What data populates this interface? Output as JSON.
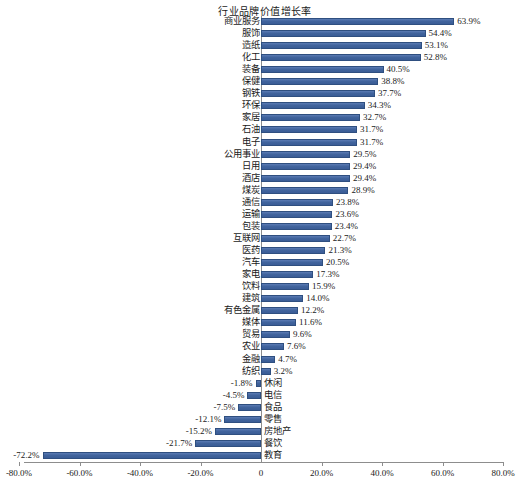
{
  "chart_data": {
    "type": "bar",
    "orientation": "horizontal",
    "title": "行业品牌价值增长率",
    "xlabel": "",
    "ylabel": "",
    "xlim": [
      -80,
      80
    ],
    "grid": false,
    "legend": null,
    "axis_tick_labels": [
      "-80.0%",
      "-60.0%",
      "-40.0%",
      "-20.0%",
      "0",
      "20.0%",
      "40.0%",
      "60.0%",
      "80.0%"
    ],
    "axis_tick_values": [
      -80,
      -60,
      -40,
      -20,
      0,
      20,
      40,
      60,
      80
    ],
    "bar_color": "#41649d",
    "bar_border_color": "#2f4f80",
    "categories": [
      "商业服务",
      "服饰",
      "造纸",
      "化工",
      "装备",
      "保健",
      "钢铁",
      "环保",
      "家居",
      "石油",
      "电子",
      "公用事业",
      "日用",
      "酒店",
      "煤炭",
      "通信",
      "运输",
      "包装",
      "互联网",
      "医药",
      "汽车",
      "家电",
      "饮料",
      "建筑",
      "有色金属",
      "媒体",
      "贸易",
      "农业",
      "金融",
      "纺织",
      "休闲",
      "电信",
      "食品",
      "零售",
      "房地产",
      "餐饮",
      "教育"
    ],
    "values": [
      63.9,
      54.4,
      53.1,
      52.8,
      40.5,
      38.8,
      37.7,
      34.3,
      32.7,
      31.7,
      31.7,
      29.5,
      29.4,
      29.4,
      28.9,
      23.8,
      23.6,
      23.4,
      22.7,
      21.3,
      20.5,
      17.3,
      15.9,
      14.0,
      12.2,
      11.6,
      9.6,
      7.6,
      4.7,
      3.2,
      -1.8,
      -4.5,
      -7.5,
      -12.1,
      -15.2,
      -21.7,
      -72.2
    ],
    "value_labels": [
      "63.9%",
      "54.4%",
      "53.1%",
      "52.8%",
      "40.5%",
      "38.8%",
      "37.7%",
      "34.3%",
      "32.7%",
      "31.7%",
      "31.7%",
      "29.5%",
      "29.4%",
      "29.4%",
      "28.9%",
      "23.8%",
      "23.6%",
      "23.4%",
      "22.7%",
      "21.3%",
      "20.5%",
      "17.3%",
      "15.9%",
      "14.0%",
      "12.2%",
      "11.6%",
      "9.6%",
      "7.6%",
      "4.7%",
      "3.2%",
      "-1.8%",
      "-4.5%",
      "-7.5%",
      "-12.1%",
      "-15.2%",
      "-21.7%",
      "-72.2%"
    ]
  }
}
